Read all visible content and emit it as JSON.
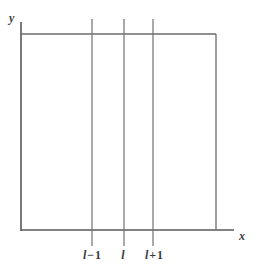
{
  "figure": {
    "background_color": "#ffffff",
    "line_color": "#6b6b6d",
    "axis_color": "#58585a",
    "text_color": "#3a3a3c",
    "axes": {
      "y_label": "y",
      "x_label": "x"
    },
    "geometry": {
      "y_axis_x": 21,
      "y_axis_top": 22,
      "y_axis_bottom": 231,
      "x_axis_y": 230,
      "x_axis_left": 21,
      "x_axis_right": 234,
      "box_left": 21,
      "box_right": 216,
      "box_top": 34,
      "box_bottom": 230,
      "grid_line_top": 19,
      "grid_line_bottom": 246
    },
    "grid_lines": [
      {
        "name": "l-minus-1",
        "x": 92,
        "symbol": "l",
        "operator": "−",
        "number": "1"
      },
      {
        "name": "l",
        "x": 124,
        "symbol": "l",
        "operator": "",
        "number": ""
      },
      {
        "name": "l-plus-1",
        "x": 153,
        "symbol": "l",
        "operator": "+",
        "number": "1"
      }
    ]
  }
}
